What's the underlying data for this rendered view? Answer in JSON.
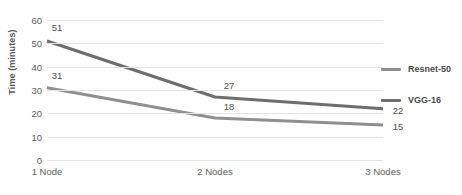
{
  "chart_data": {
    "type": "line",
    "title": "",
    "xlabel": "",
    "ylabel": "Time (minutes)",
    "categories": [
      "1 Node",
      "2 Nodes",
      "3 Nodes"
    ],
    "ylim": [
      0,
      60
    ],
    "yticks": [
      0,
      10,
      20,
      30,
      40,
      50,
      60
    ],
    "grid": true,
    "legend_position": "right",
    "series": [
      {
        "name": "Resnet-50",
        "values": [
          31,
          18,
          15
        ],
        "color": "#909090"
      },
      {
        "name": "VGG-16",
        "values": [
          51,
          27,
          22
        ],
        "color": "#6e6e6e"
      }
    ]
  },
  "legend": {
    "entries": [
      {
        "label": "Resnet-50",
        "color": "#909090"
      },
      {
        "label": "VGG-16",
        "color": "#6e6e6e"
      }
    ]
  },
  "axes": {
    "y_title": "Time (minutes)",
    "y_tick_labels": [
      "60",
      "50",
      "40",
      "30",
      "20",
      "10",
      "0"
    ],
    "x_tick_labels": [
      "1 Node",
      "2 Nodes",
      "3 Nodes"
    ]
  },
  "point_labels": {
    "vgg": [
      "51",
      "27",
      "22"
    ],
    "resnet": [
      "31",
      "18",
      "15"
    ]
  },
  "colors": {
    "gridline": "#e4e4e4",
    "text": "#5e5e5e",
    "background": "#ffffff"
  }
}
